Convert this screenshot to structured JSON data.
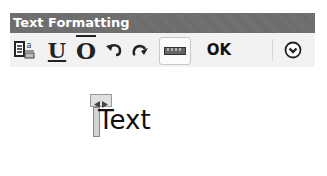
{
  "window": {
    "title": "Text Formatting"
  },
  "toolbar": {
    "items": [
      {
        "icon": "stack-format-icon",
        "label": ""
      },
      {
        "icon": "underline-icon",
        "label": "U"
      },
      {
        "icon": "overline-icon",
        "label": "O"
      },
      {
        "icon": "undo-icon",
        "label": "↶"
      },
      {
        "icon": "redo-icon",
        "label": "↷"
      },
      {
        "icon": "ruler-icon",
        "label": ""
      },
      {
        "icon": "ok-button",
        "label": "OK"
      },
      {
        "icon": "options-chevron-icon",
        "label": "⌄"
      }
    ],
    "ok_label": "OK"
  },
  "editor": {
    "text": "Text"
  }
}
